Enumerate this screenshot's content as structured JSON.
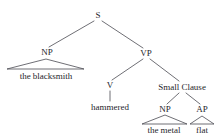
{
  "figure": {
    "type": "syntax-tree",
    "sentence": "the blacksmith hammered the metal flat",
    "background_color": "#ffffff",
    "line_color": "#4a4a52",
    "text_color": "#26262b"
  },
  "nodes": {
    "s": {
      "label": "S",
      "x": 98,
      "y": 18
    },
    "np_subject": {
      "label": "NP",
      "x": 47,
      "y": 55
    },
    "vp": {
      "label": "VP",
      "x": 146,
      "y": 56
    },
    "v": {
      "label": "V",
      "x": 110,
      "y": 88
    },
    "small_clause": {
      "label": "Small Clause",
      "x": 182,
      "y": 90
    },
    "np_object": {
      "label": "NP",
      "x": 165,
      "y": 112
    },
    "ap": {
      "label": "AP",
      "x": 202,
      "y": 112
    }
  },
  "leaves": {
    "subject": {
      "text": "the blacksmith",
      "x": 46,
      "y": 79
    },
    "verb": {
      "text": "hammered",
      "x": 110,
      "y": 110
    },
    "object": {
      "text": "the metal",
      "x": 164,
      "y": 133
    },
    "predicate": {
      "text": "flat",
      "x": 202,
      "y": 133
    }
  },
  "edges": [
    {
      "name": "s-to-np",
      "from": "S",
      "to": "NP",
      "x1": 94,
      "y1": 21,
      "x2": 49,
      "y2": 47
    },
    {
      "name": "s-to-vp",
      "from": "S",
      "to": "VP",
      "x1": 102,
      "y1": 21,
      "x2": 143,
      "y2": 48
    },
    {
      "name": "vp-to-v",
      "from": "VP",
      "to": "V",
      "x1": 143,
      "y1": 59,
      "x2": 112,
      "y2": 80
    },
    {
      "name": "vp-to-small-clause",
      "from": "VP",
      "to": "Small Clause",
      "x1": 150,
      "y1": 59,
      "x2": 179,
      "y2": 81
    },
    {
      "name": "small-clause-to-np",
      "from": "Small Clause",
      "to": "NP",
      "x1": 179,
      "y1": 93,
      "x2": 167,
      "y2": 104
    },
    {
      "name": "small-clause-to-ap",
      "from": "Small Clause",
      "to": "AP",
      "x1": 186,
      "y1": 93,
      "x2": 200,
      "y2": 104
    },
    {
      "name": "v-to-hammered",
      "from": "V",
      "to": "hammered",
      "x1": 110,
      "y1": 91,
      "x2": 110,
      "y2": 101
    }
  ],
  "triangles": [
    {
      "name": "np-subject-triangle",
      "apex_x": 46,
      "apex_y": 59,
      "left_x": 7,
      "right_x": 84,
      "base_y": 69
    },
    {
      "name": "np-object-triangle",
      "apex_x": 165,
      "apex_y": 115,
      "left_x": 142,
      "right_x": 187,
      "base_y": 124
    },
    {
      "name": "ap-triangle",
      "apex_x": 202,
      "apex_y": 116,
      "left_x": 190,
      "right_x": 214,
      "base_y": 124
    }
  ]
}
